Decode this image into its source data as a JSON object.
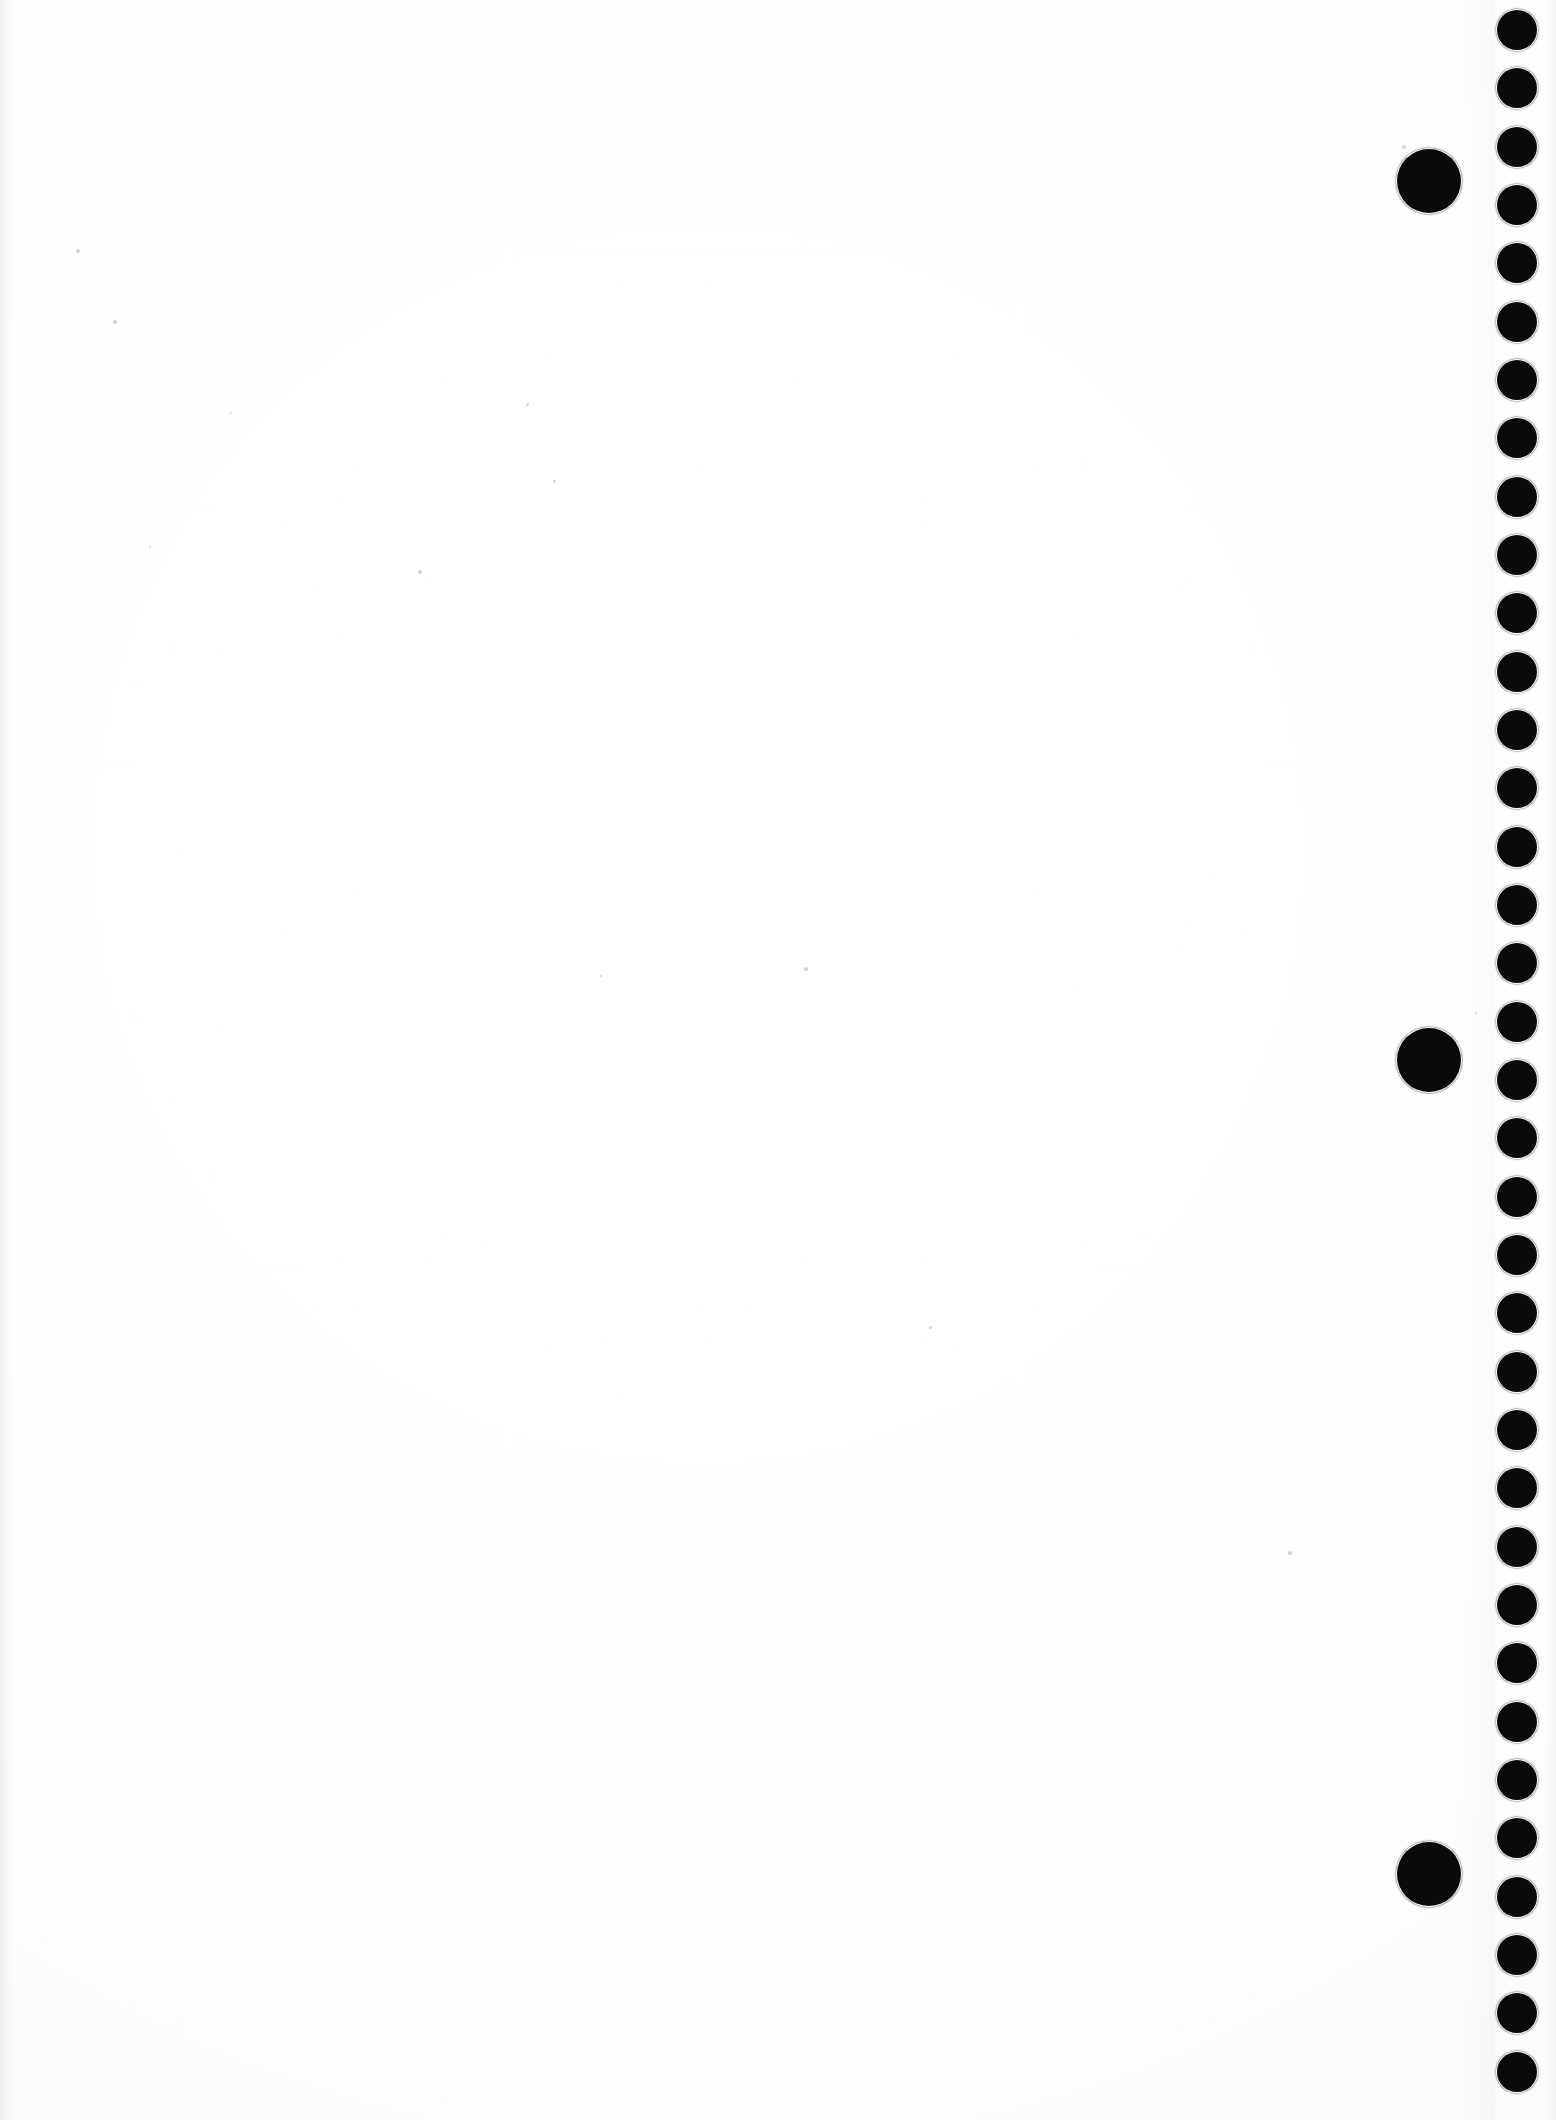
{
  "page": {
    "kind": "scanned-page",
    "width": 1556,
    "height": 2120,
    "background_color": "#fdfdfd",
    "ink_color": "#0a0a0a",
    "content_text": "",
    "note": "Blank scanned sheet; only a vertical column of printed register dots along the right edge is visible."
  },
  "chart_data": {
    "type": "scatter",
    "title": "",
    "xlabel": "",
    "ylabel": "",
    "xlim": [
      0,
      1556
    ],
    "ylim": [
      0,
      2120
    ],
    "grid": false,
    "legend": "none",
    "series": [
      {
        "name": "register-dots-small",
        "marker": "filled-circle",
        "color": "#0a0a0a",
        "diameter_px": 40,
        "count": 36,
        "cx": 1517,
        "y_start": 30,
        "y_step": 58.3,
        "points_y": [
          30,
          88,
          147,
          205,
          263,
          322,
          380,
          438,
          497,
          555,
          613,
          672,
          730,
          788,
          847,
          905,
          963,
          1022,
          1080,
          1138,
          1197,
          1255,
          1313,
          1372,
          1430,
          1488,
          1547,
          1605,
          1663,
          1722,
          1780,
          1838,
          1897,
          1955,
          2013,
          2072
        ]
      },
      {
        "name": "register-dots-large",
        "marker": "filled-circle",
        "color": "#0a0a0a",
        "diameter_px": 64,
        "count": 3,
        "cx": 1429,
        "points_y": [
          181,
          1060,
          1874
        ]
      }
    ]
  },
  "artifacts": {
    "specks": [
      {
        "x": 78,
        "y": 251,
        "r": 2.0
      },
      {
        "x": 115,
        "y": 322,
        "r": 1.6
      },
      {
        "x": 231,
        "y": 413,
        "r": 1.4
      },
      {
        "x": 527,
        "y": 404,
        "r": 1.5
      },
      {
        "x": 420,
        "y": 572,
        "r": 2.0
      },
      {
        "x": 150,
        "y": 547,
        "r": 1.4
      },
      {
        "x": 554,
        "y": 481,
        "r": 1.5
      },
      {
        "x": 806,
        "y": 969,
        "r": 1.6
      },
      {
        "x": 601,
        "y": 976,
        "r": 1.4
      },
      {
        "x": 930,
        "y": 1327,
        "r": 1.5
      },
      {
        "x": 1290,
        "y": 1553,
        "r": 1.6
      },
      {
        "x": 1404,
        "y": 147,
        "r": 1.8
      },
      {
        "x": 1476,
        "y": 1013,
        "r": 1.4
      }
    ]
  }
}
